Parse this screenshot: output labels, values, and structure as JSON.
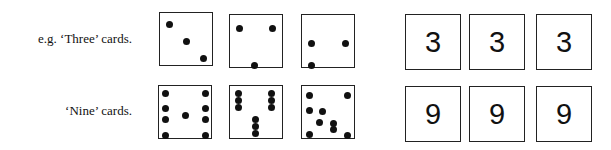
{
  "rows": [
    {
      "label": "e.g. ‘Three’ cards.",
      "number": "3",
      "dot_cards": [
        {
          "count": 3,
          "dots": [
            [
              9,
              11
            ],
            [
              26,
              28
            ],
            [
              43,
              45
            ]
          ]
        },
        {
          "count": 3,
          "dots": [
            [
              9,
              13
            ],
            [
              42,
              13
            ],
            [
              24,
              50
            ]
          ]
        },
        {
          "count": 3,
          "dots": [
            [
              9,
              28
            ],
            [
              43,
              28
            ],
            [
              9,
              50
            ]
          ]
        }
      ],
      "number_cards": [
        "3",
        "3",
        "3"
      ]
    },
    {
      "label": "‘Nine’ cards.",
      "number": "9",
      "dot_cards": [
        {
          "count": 9,
          "dots": [
            [
              6,
              7
            ],
            [
              6,
              22
            ],
            [
              6,
              33
            ],
            [
              6,
              49
            ],
            [
              26,
              29
            ],
            [
              46,
              7
            ],
            [
              46,
              22
            ],
            [
              46,
              33
            ],
            [
              46,
              49
            ]
          ]
        },
        {
          "count": 9,
          "dots": [
            [
              8,
              7
            ],
            [
              8,
              14
            ],
            [
              8,
              21
            ],
            [
              41,
              7
            ],
            [
              41,
              14
            ],
            [
              41,
              21
            ],
            [
              25,
              33
            ],
            [
              25,
              40
            ],
            [
              25,
              47
            ]
          ]
        },
        {
          "count": 9,
          "dots": [
            [
              7,
              9
            ],
            [
              7,
              24
            ],
            [
              7,
              48
            ],
            [
              45,
              9
            ],
            [
              20,
              25
            ],
            [
              17,
              36
            ],
            [
              31,
              37
            ],
            [
              31,
              43
            ],
            [
              45,
              49
            ]
          ]
        }
      ],
      "number_cards": [
        "9",
        "9",
        "9"
      ]
    }
  ]
}
